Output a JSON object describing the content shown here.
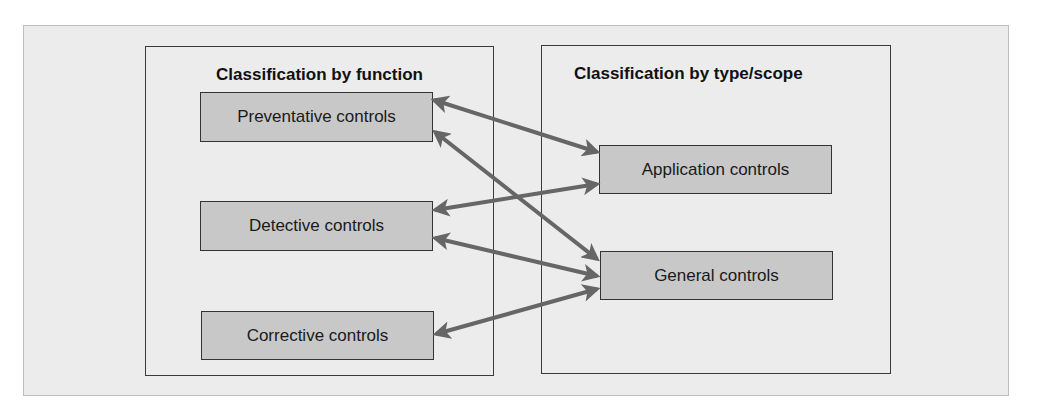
{
  "diagram": {
    "left_group": {
      "title": "Classification by function",
      "nodes": [
        {
          "id": "preventative",
          "label": "Preventative controls"
        },
        {
          "id": "detective",
          "label": "Detective controls"
        },
        {
          "id": "corrective",
          "label": "Corrective controls"
        }
      ]
    },
    "right_group": {
      "title": "Classification by type/scope",
      "nodes": [
        {
          "id": "application",
          "label": "Application controls"
        },
        {
          "id": "general",
          "label": "General controls"
        }
      ]
    },
    "edges": [
      {
        "from": "preventative",
        "to": "application",
        "type": "bidirectional"
      },
      {
        "from": "preventative",
        "to": "general",
        "type": "bidirectional"
      },
      {
        "from": "detective",
        "to": "application",
        "type": "bidirectional"
      },
      {
        "from": "detective",
        "to": "general",
        "type": "bidirectional"
      },
      {
        "from": "corrective",
        "to": "general",
        "type": "bidirectional"
      }
    ],
    "colors": {
      "panel_bg": "#ececec",
      "node_fill": "#c8c8c8",
      "arrow": "#666666",
      "border": "#333333"
    }
  }
}
